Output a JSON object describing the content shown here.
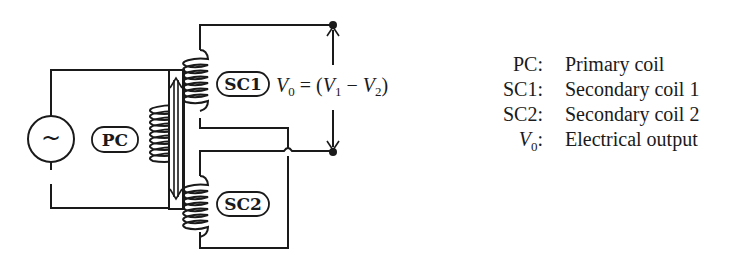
{
  "diagram": {
    "source_symbol": "~",
    "labels": {
      "primary": "PC",
      "secondary1": "SC1",
      "secondary2": "SC2"
    },
    "equation": {
      "lhs_var": "V",
      "lhs_sub": "0",
      "eq": " = (",
      "v1_var": "V",
      "v1_sub": "1",
      "minus": " − ",
      "v2_var": "V",
      "v2_sub": "2",
      "close": ")"
    }
  },
  "legend": [
    {
      "key": "PC:",
      "value": "Primary coil"
    },
    {
      "key": "SC1:",
      "value": "Secondary coil 1"
    },
    {
      "key": "SC2:",
      "value": "Secondary coil 2"
    },
    {
      "key_var": "V",
      "key_sub": "0",
      "key_suffix": ":",
      "value": "Electrical output"
    }
  ]
}
